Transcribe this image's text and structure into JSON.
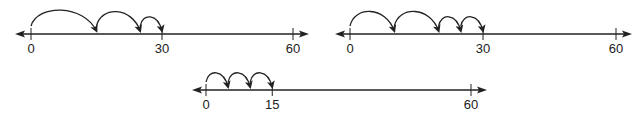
{
  "figure": {
    "stroke_color": "#222222",
    "background": "#ffffff"
  },
  "number_lines": [
    {
      "id": "line-1",
      "min": 0,
      "max": 60,
      "ticks": [
        0,
        30,
        60
      ],
      "tick_labels": [
        "0",
        "30",
        "60"
      ],
      "jumps": [
        [
          0,
          15
        ],
        [
          15,
          25
        ],
        [
          25,
          30
        ]
      ],
      "geometry": {
        "x0": 31,
        "x60": 293,
        "y": 34,
        "arrow_left": 15,
        "arrow_right": 309
      }
    },
    {
      "id": "line-2",
      "min": 0,
      "max": 60,
      "ticks": [
        0,
        30,
        60
      ],
      "tick_labels": [
        "0",
        "30",
        "60"
      ],
      "jumps": [
        [
          0,
          10
        ],
        [
          10,
          20
        ],
        [
          20,
          25
        ],
        [
          25,
          30
        ]
      ],
      "geometry": {
        "x0": 350,
        "x60": 616,
        "y": 34,
        "arrow_left": 335,
        "arrow_right": 632
      }
    },
    {
      "id": "line-3",
      "min": 0,
      "max": 60,
      "ticks": [
        0,
        15,
        60
      ],
      "tick_labels": [
        "0",
        "15",
        "60"
      ],
      "jumps": [
        [
          0,
          5
        ],
        [
          5,
          10
        ],
        [
          10,
          15
        ]
      ],
      "geometry": {
        "x0": 206,
        "x60": 471,
        "y": 90,
        "arrow_left": 192,
        "arrow_right": 487
      }
    }
  ]
}
